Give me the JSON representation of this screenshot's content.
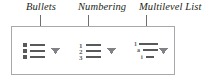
{
  "figure": {
    "type": "annotated-ui-callout",
    "background_color": "#ffffff",
    "box_border_color": "#a6a8ab",
    "leader_line_color": "#6d6e71",
    "label_color": "#231f20",
    "icon_color": "#58595b"
  },
  "callouts": [
    {
      "id": "bullets",
      "label": "Bullets"
    },
    {
      "id": "numbering",
      "label": "Numbering"
    },
    {
      "id": "multilevel",
      "label": "Multilevel List"
    }
  ],
  "ribbon_group": {
    "buttons": [
      {
        "id": "bullets",
        "name": "Bullets",
        "icon": "bullet-list-icon",
        "dropdown_icon": "chevron-down-icon",
        "has_dropdown": true,
        "rows": [
          {
            "marker": "■",
            "marker_type": "square-bullet"
          },
          {
            "marker": "■",
            "marker_type": "square-bullet"
          },
          {
            "marker": "■",
            "marker_type": "square-bullet"
          }
        ]
      },
      {
        "id": "numbering",
        "name": "Numbering",
        "icon": "numbered-list-icon",
        "dropdown_icon": "chevron-down-icon",
        "has_dropdown": true,
        "rows": [
          {
            "marker": "1",
            "marker_type": "arabic-numeral"
          },
          {
            "marker": "2",
            "marker_type": "arabic-numeral"
          },
          {
            "marker": "3",
            "marker_type": "arabic-numeral"
          }
        ]
      },
      {
        "id": "multilevel",
        "name": "Multilevel List",
        "icon": "multilevel-list-icon",
        "dropdown_icon": "chevron-down-icon",
        "has_dropdown": true,
        "rows": [
          {
            "marker": "1",
            "marker_type": "arabic-numeral",
            "level": 1
          },
          {
            "marker": "a",
            "marker_type": "lower-alpha",
            "level": 2
          },
          {
            "marker": "i",
            "marker_type": "lower-roman",
            "level": 3
          }
        ]
      }
    ]
  }
}
